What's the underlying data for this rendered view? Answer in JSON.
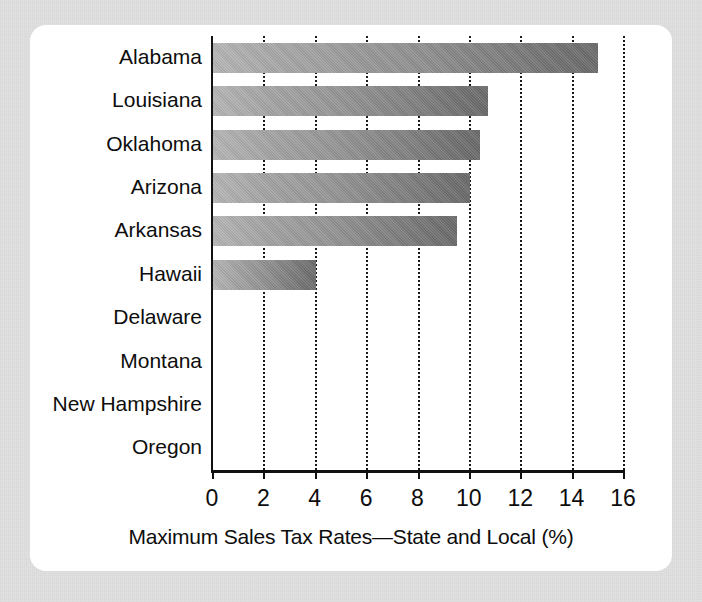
{
  "chart_data": {
    "type": "bar",
    "orientation": "horizontal",
    "title": "",
    "xlabel": "Maximum Sales Tax Rates—State and Local (%)",
    "ylabel": "",
    "categories": [
      "Alabama",
      "Louisiana",
      "Oklahoma",
      "Arizona",
      "Arkansas",
      "Hawaii",
      "Delaware",
      "Montana",
      "New Hampshire",
      "Oregon"
    ],
    "values": [
      15.0,
      10.7,
      10.4,
      10.0,
      9.5,
      4.0,
      0,
      0,
      0,
      0
    ],
    "xlim": [
      0,
      16
    ],
    "xticks": [
      0,
      2,
      4,
      6,
      8,
      10,
      12,
      14,
      16
    ],
    "xtick_labels": [
      "0",
      "2",
      "4",
      "6",
      "8",
      "10",
      "12",
      "14",
      "16"
    ],
    "grid": "vertical-dotted",
    "legend": "none",
    "bar_gradient_light": "#b4b4b4",
    "bar_gradient_dark": "#6a6a6a",
    "axis_color": "#111111",
    "panel_background": "#ffffff",
    "frame_background": "#e0e0e0"
  }
}
